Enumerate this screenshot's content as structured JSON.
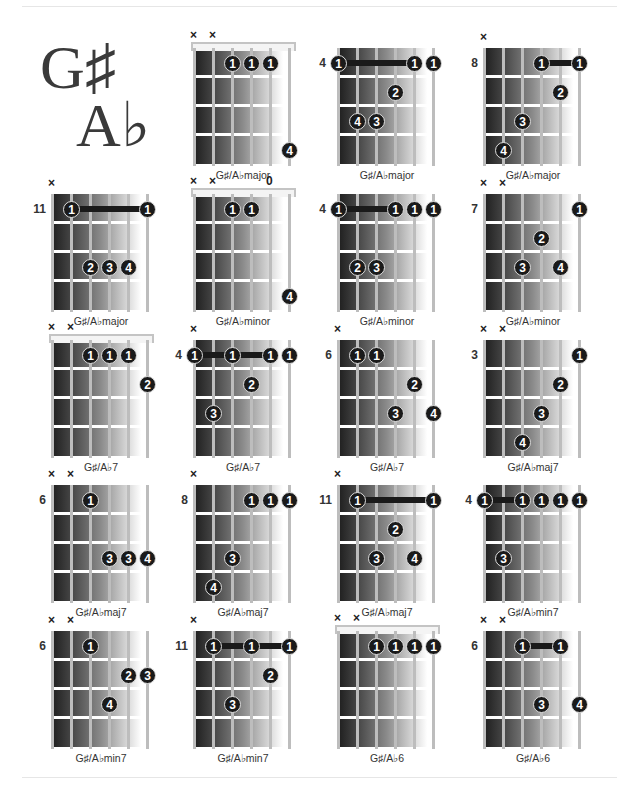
{
  "page": {
    "title_sharp": "G♯",
    "title_flat": "A♭"
  },
  "chord_data": [
    {
      "name": "G♯/A♭major",
      "col": 1,
      "row": 0,
      "nut": true,
      "position": "",
      "markers": [
        "x",
        "x",
        "",
        "",
        "",
        ""
      ],
      "dots": [
        {
          "s": 2,
          "f": 1,
          "n": "1"
        },
        {
          "s": 3,
          "f": 1,
          "n": "1"
        },
        {
          "s": 4,
          "f": 1,
          "n": "1"
        },
        {
          "s": 5,
          "f": 4,
          "n": "4"
        }
      ],
      "barre": null
    },
    {
      "name": "G♯/A♭major",
      "col": 2,
      "row": 0,
      "nut": false,
      "position": "4",
      "markers": [
        "",
        "",
        "",
        "",
        "",
        ""
      ],
      "dots": [
        {
          "s": 0,
          "f": 1,
          "n": "1"
        },
        {
          "s": 4,
          "f": 1,
          "n": "1"
        },
        {
          "s": 5,
          "f": 1,
          "n": "1"
        },
        {
          "s": 3,
          "f": 2,
          "n": "2"
        },
        {
          "s": 1,
          "f": 3,
          "n": "4"
        },
        {
          "s": 2,
          "f": 3,
          "n": "3"
        }
      ],
      "barre": {
        "from": 0,
        "to": 4,
        "f": 1
      }
    },
    {
      "name": "G♯/A♭major",
      "col": 3,
      "row": 0,
      "nut": false,
      "position": "8",
      "markers": [
        "x",
        "",
        "",
        "",
        "",
        ""
      ],
      "dots": [
        {
          "s": 3,
          "f": 1,
          "n": "1"
        },
        {
          "s": 5,
          "f": 1,
          "n": "1"
        },
        {
          "s": 4,
          "f": 2,
          "n": "2"
        },
        {
          "s": 2,
          "f": 3,
          "n": "3"
        },
        {
          "s": 1,
          "f": 4,
          "n": "4"
        }
      ],
      "barre": {
        "from": 3,
        "to": 5,
        "f": 1
      }
    },
    {
      "name": "G♯/A♭major",
      "col": 0,
      "row": 1,
      "nut": false,
      "position": "11",
      "markers": [
        "x",
        "",
        "",
        "",
        "",
        ""
      ],
      "dots": [
        {
          "s": 1,
          "f": 1,
          "n": "1"
        },
        {
          "s": 5,
          "f": 1,
          "n": "1"
        },
        {
          "s": 2,
          "f": 3,
          "n": "2"
        },
        {
          "s": 3,
          "f": 3,
          "n": "3"
        },
        {
          "s": 4,
          "f": 3,
          "n": "4"
        }
      ],
      "barre": {
        "from": 1,
        "to": 5,
        "f": 1
      }
    },
    {
      "name": "G♯/A♭minor",
      "col": 1,
      "row": 1,
      "nut": true,
      "position": "",
      "markers": [
        "x",
        "x",
        "",
        "",
        "0",
        ""
      ],
      "dots": [
        {
          "s": 2,
          "f": 1,
          "n": "1"
        },
        {
          "s": 3,
          "f": 1,
          "n": "1"
        },
        {
          "s": 5,
          "f": 4,
          "n": "4"
        }
      ],
      "barre": null
    },
    {
      "name": "G♯/A♭minor",
      "col": 2,
      "row": 1,
      "nut": false,
      "position": "4",
      "markers": [
        "",
        "",
        "",
        "",
        "",
        ""
      ],
      "dots": [
        {
          "s": 0,
          "f": 1,
          "n": "1"
        },
        {
          "s": 3,
          "f": 1,
          "n": "1"
        },
        {
          "s": 4,
          "f": 1,
          "n": "1"
        },
        {
          "s": 5,
          "f": 1,
          "n": "1"
        },
        {
          "s": 1,
          "f": 3,
          "n": "2"
        },
        {
          "s": 2,
          "f": 3,
          "n": "3"
        }
      ],
      "barre": {
        "from": 0,
        "to": 3,
        "f": 1
      }
    },
    {
      "name": "G♯/A♭minor",
      "col": 3,
      "row": 1,
      "nut": false,
      "position": "7",
      "markers": [
        "x",
        "x",
        "",
        "",
        "",
        ""
      ],
      "dots": [
        {
          "s": 5,
          "f": 1,
          "n": "1"
        },
        {
          "s": 3,
          "f": 2,
          "n": "2"
        },
        {
          "s": 2,
          "f": 3,
          "n": "3"
        },
        {
          "s": 4,
          "f": 3,
          "n": "4"
        }
      ],
      "barre": null
    },
    {
      "name": "G♯/A♭7",
      "col": 0,
      "row": 2,
      "nut": true,
      "position": "",
      "markers": [
        "x",
        "x",
        "",
        "",
        "",
        ""
      ],
      "dots": [
        {
          "s": 2,
          "f": 1,
          "n": "1"
        },
        {
          "s": 3,
          "f": 1,
          "n": "1"
        },
        {
          "s": 4,
          "f": 1,
          "n": "1"
        },
        {
          "s": 5,
          "f": 2,
          "n": "2"
        }
      ],
      "barre": null
    },
    {
      "name": "G♯/A♭7",
      "col": 1,
      "row": 2,
      "nut": false,
      "position": "4",
      "markers": [
        "x",
        "",
        "",
        "",
        "",
        ""
      ],
      "dots": [
        {
          "s": 0,
          "f": 1,
          "n": "1"
        },
        {
          "s": 2,
          "f": 1,
          "n": "1"
        },
        {
          "s": 4,
          "f": 1,
          "n": "1"
        },
        {
          "s": 5,
          "f": 1,
          "n": "1"
        },
        {
          "s": 3,
          "f": 2,
          "n": "2"
        },
        {
          "s": 1,
          "f": 3,
          "n": "3"
        }
      ],
      "barre": {
        "from": 0,
        "to": 4,
        "f": 1
      }
    },
    {
      "name": "G♯/A♭7",
      "col": 2,
      "row": 2,
      "nut": false,
      "position": "6",
      "markers": [
        "x",
        "",
        "",
        "",
        "",
        ""
      ],
      "dots": [
        {
          "s": 1,
          "f": 1,
          "n": "1"
        },
        {
          "s": 2,
          "f": 1,
          "n": "1"
        },
        {
          "s": 4,
          "f": 2,
          "n": "2"
        },
        {
          "s": 3,
          "f": 3,
          "n": "3"
        },
        {
          "s": 5,
          "f": 3,
          "n": "4"
        }
      ],
      "barre": null
    },
    {
      "name": "G♯/A♭maj7",
      "col": 3,
      "row": 2,
      "nut": false,
      "position": "3",
      "markers": [
        "x",
        "x",
        "",
        "",
        "",
        ""
      ],
      "dots": [
        {
          "s": 5,
          "f": 1,
          "n": "1"
        },
        {
          "s": 4,
          "f": 2,
          "n": "2"
        },
        {
          "s": 3,
          "f": 3,
          "n": "3"
        },
        {
          "s": 2,
          "f": 4,
          "n": "4"
        }
      ],
      "barre": null
    },
    {
      "name": "G♯/A♭maj7",
      "col": 0,
      "row": 3,
      "nut": false,
      "position": "6",
      "markers": [
        "x",
        "x",
        "",
        "",
        "",
        ""
      ],
      "dots": [
        {
          "s": 2,
          "f": 1,
          "n": "1"
        },
        {
          "s": 3,
          "f": 3,
          "n": "3"
        },
        {
          "s": 4,
          "f": 3,
          "n": "3"
        },
        {
          "s": 5,
          "f": 3,
          "n": "4"
        }
      ],
      "barre": null
    },
    {
      "name": "G♯/A♭maj7",
      "col": 1,
      "row": 3,
      "nut": false,
      "position": "8",
      "markers": [
        "x",
        "",
        "",
        "",
        "",
        ""
      ],
      "dots": [
        {
          "s": 3,
          "f": 1,
          "n": "1"
        },
        {
          "s": 4,
          "f": 1,
          "n": "1"
        },
        {
          "s": 5,
          "f": 1,
          "n": "1"
        },
        {
          "s": 2,
          "f": 3,
          "n": "3"
        },
        {
          "s": 1,
          "f": 4,
          "n": "4"
        }
      ],
      "barre": null
    },
    {
      "name": "G♯/A♭maj7",
      "col": 2,
      "row": 3,
      "nut": false,
      "position": "11",
      "markers": [
        "x",
        "",
        "",
        "",
        "",
        ""
      ],
      "dots": [
        {
          "s": 1,
          "f": 1,
          "n": "1"
        },
        {
          "s": 5,
          "f": 1,
          "n": "1"
        },
        {
          "s": 3,
          "f": 2,
          "n": "2"
        },
        {
          "s": 2,
          "f": 3,
          "n": "3"
        },
        {
          "s": 4,
          "f": 3,
          "n": "4"
        }
      ],
      "barre": {
        "from": 1,
        "to": 5,
        "f": 1
      }
    },
    {
      "name": "G♯/A♭min7",
      "col": 3,
      "row": 3,
      "nut": false,
      "position": "4",
      "markers": [
        "",
        "",
        "",
        "",
        "",
        ""
      ],
      "dots": [
        {
          "s": 0,
          "f": 1,
          "n": "1"
        },
        {
          "s": 2,
          "f": 1,
          "n": "1"
        },
        {
          "s": 3,
          "f": 1,
          "n": "1"
        },
        {
          "s": 4,
          "f": 1,
          "n": "1"
        },
        {
          "s": 5,
          "f": 1,
          "n": "1"
        },
        {
          "s": 1,
          "f": 3,
          "n": "3"
        }
      ],
      "barre": {
        "from": 0,
        "to": 2,
        "f": 1
      }
    },
    {
      "name": "G♯/A♭min7",
      "col": 0,
      "row": 4,
      "nut": false,
      "position": "6",
      "markers": [
        "x",
        "x",
        "",
        "",
        "",
        ""
      ],
      "dots": [
        {
          "s": 2,
          "f": 1,
          "n": "1"
        },
        {
          "s": 4,
          "f": 2,
          "n": "2"
        },
        {
          "s": 5,
          "f": 2,
          "n": "3"
        },
        {
          "s": 3,
          "f": 3,
          "n": "4"
        }
      ],
      "barre": null
    },
    {
      "name": "G♯/A♭min7",
      "col": 1,
      "row": 4,
      "nut": false,
      "position": "11",
      "markers": [
        "x",
        "",
        "",
        "",
        "",
        ""
      ],
      "dots": [
        {
          "s": 1,
          "f": 1,
          "n": "1"
        },
        {
          "s": 3,
          "f": 1,
          "n": "1"
        },
        {
          "s": 5,
          "f": 1,
          "n": "1"
        },
        {
          "s": 4,
          "f": 2,
          "n": "2"
        },
        {
          "s": 2,
          "f": 3,
          "n": "3"
        }
      ],
      "barre": {
        "from": 1,
        "to": 5,
        "f": 1
      }
    },
    {
      "name": "G♯/A♭6",
      "col": 2,
      "row": 4,
      "nut": true,
      "position": "",
      "markers": [
        "x",
        "x",
        "",
        "",
        "",
        ""
      ],
      "dots": [
        {
          "s": 2,
          "f": 1,
          "n": "1"
        },
        {
          "s": 3,
          "f": 1,
          "n": "1"
        },
        {
          "s": 4,
          "f": 1,
          "n": "1"
        },
        {
          "s": 5,
          "f": 1,
          "n": "1"
        }
      ],
      "barre": null
    },
    {
      "name": "G♯/A♭6",
      "col": 3,
      "row": 4,
      "nut": false,
      "position": "6",
      "markers": [
        "x",
        "x",
        "",
        "",
        "",
        ""
      ],
      "dots": [
        {
          "s": 2,
          "f": 1,
          "n": "1"
        },
        {
          "s": 4,
          "f": 1,
          "n": "1"
        },
        {
          "s": 3,
          "f": 3,
          "n": "3"
        },
        {
          "s": 5,
          "f": 3,
          "n": "4"
        }
      ],
      "barre": {
        "from": 2,
        "to": 4,
        "f": 1
      }
    }
  ]
}
